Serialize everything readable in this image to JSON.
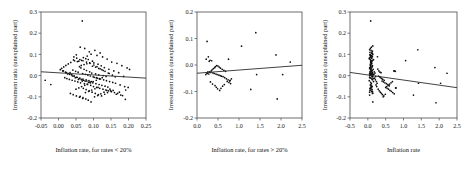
{
  "figure": {
    "background": "#ffffff",
    "point_color": "#0d0d0d",
    "axis_color": "#4a4a4a",
    "line_color": "#2b2b2b"
  },
  "chart_data": [
    {
      "type": "scatter",
      "title": "",
      "xlabel": "Inflation rate, for rates < 20%",
      "ylabel": "Investment ratio (unexplained part)",
      "xlim": [
        -0.05,
        0.25
      ],
      "ylim": [
        -0.2,
        0.3
      ],
      "xticks": [
        "-0.05",
        "0.00",
        "0.05",
        "0.10",
        "0.15",
        "0.20",
        "0.25"
      ],
      "xtick_values": [
        -0.05,
        0.0,
        0.05,
        0.1,
        0.15,
        0.2,
        0.25
      ],
      "yticks": [
        "0.3",
        "0.2",
        "0.1",
        "0.0",
        "-0.1",
        "-0.2"
      ],
      "ytick_values": [
        0.3,
        0.2,
        0.1,
        0.0,
        -0.1,
        -0.2
      ],
      "grid": false,
      "legend": "none",
      "trend_line": {
        "x0": -0.05,
        "y0": 0.018,
        "x1": 0.25,
        "y1": -0.012
      },
      "x": [
        0.068,
        0.062,
        0.075,
        0.088,
        0.051,
        0.104,
        0.119,
        0.082,
        0.071,
        0.093,
        0.043,
        0.058,
        0.11,
        0.126,
        0.139,
        0.152,
        0.167,
        0.181,
        0.196,
        0.203,
        0.035,
        0.028,
        0.021,
        0.015,
        0.009,
        0.046,
        0.054,
        0.066,
        0.078,
        0.085,
        0.097,
        0.101,
        0.113,
        0.122,
        0.131,
        0.144,
        0.158,
        0.172,
        0.186,
        0.191,
        0.06,
        0.064,
        0.073,
        0.08,
        0.089,
        0.095,
        0.106,
        0.115,
        0.128,
        0.136,
        0.041,
        0.049,
        0.056,
        0.069,
        0.077,
        0.084,
        0.091,
        0.099,
        0.108,
        0.117,
        0.033,
        0.026,
        0.038,
        0.044,
        0.052,
        0.061,
        0.07,
        0.079,
        0.087,
        0.094,
        0.102,
        0.111,
        0.12,
        0.129,
        0.137,
        0.146,
        0.155,
        0.163,
        0.176,
        0.189,
        0.065,
        0.072,
        0.081,
        0.09,
        0.098,
        0.107,
        0.116,
        0.124,
        0.133,
        0.141,
        0.018,
        0.024,
        0.031,
        0.039,
        0.047,
        0.055,
        0.063,
        0.074,
        0.083,
        0.092,
        0.1,
        0.109,
        0.118,
        0.127,
        0.135,
        0.143,
        0.151,
        0.16,
        0.169,
        0.178,
        0.012,
        0.02,
        0.029,
        0.037,
        0.045,
        0.053,
        0.059,
        0.067,
        0.076,
        0.086,
        -0.038,
        -0.022,
        0.005,
        0.014,
        0.023,
        0.032,
        0.04,
        0.048,
        0.057,
        0.068,
        0.071,
        0.079,
        0.088,
        0.096,
        0.105,
        0.114,
        0.123,
        0.132,
        0.14,
        0.149,
        0.062,
        0.07,
        0.078,
        0.085,
        0.093,
        0.103,
        0.112,
        0.121,
        0.13,
        0.138,
        0.05,
        0.058,
        0.066,
        0.075,
        0.082,
        0.091,
        0.099,
        0.108,
        0.117,
        0.125,
        0.034,
        0.042,
        0.051,
        0.06,
        0.069,
        0.077,
        0.086,
        0.095,
        0.104,
        0.113,
        0.147,
        0.156,
        0.165,
        0.174,
        0.183,
        0.192,
        0.199,
        0.145,
        0.154,
        0.162,
        0.065,
        0.073,
        0.081,
        0.089,
        0.097,
        0.106,
        0.115,
        0.124,
        0.133,
        0.142,
        0.044,
        0.052,
        0.061,
        0.07,
        0.08,
        0.09,
        0.101,
        0.11,
        0.119,
        0.128
      ],
      "y": [
        0.258,
        0.134,
        0.128,
        0.112,
        0.098,
        0.119,
        0.107,
        0.092,
        0.085,
        0.101,
        0.074,
        0.068,
        0.095,
        0.088,
        0.078,
        0.064,
        0.058,
        0.047,
        0.036,
        0.029,
        0.062,
        0.055,
        0.048,
        0.041,
        0.034,
        0.07,
        0.066,
        0.072,
        0.08,
        0.076,
        0.068,
        0.06,
        0.054,
        0.046,
        0.038,
        0.03,
        0.022,
        0.014,
        -0.004,
        -0.112,
        0.042,
        0.036,
        0.03,
        0.024,
        0.018,
        0.012,
        0.008,
        0.004,
        0.0,
        -0.004,
        0.026,
        0.02,
        0.016,
        0.01,
        0.006,
        0.002,
        -0.002,
        -0.006,
        -0.01,
        -0.014,
        0.014,
        0.008,
        0.004,
        -0.002,
        -0.008,
        -0.012,
        -0.016,
        -0.02,
        -0.024,
        -0.028,
        -0.008,
        -0.012,
        -0.016,
        -0.02,
        -0.024,
        -0.028,
        -0.032,
        -0.036,
        -0.044,
        -0.052,
        -0.018,
        -0.022,
        -0.026,
        -0.03,
        -0.034,
        -0.038,
        -0.042,
        -0.046,
        -0.05,
        -0.054,
        -0.01,
        -0.014,
        -0.018,
        -0.022,
        -0.026,
        -0.03,
        -0.034,
        -0.038,
        -0.042,
        -0.046,
        -0.052,
        -0.056,
        -0.06,
        -0.064,
        -0.068,
        -0.072,
        -0.076,
        -0.08,
        -0.084,
        -0.092,
        0.022,
        0.016,
        0.01,
        0.004,
        -0.002,
        -0.008,
        -0.014,
        -0.02,
        -0.026,
        -0.032,
        -0.022,
        -0.042,
        0.028,
        0.022,
        0.014,
        0.006,
        -0.002,
        -0.01,
        -0.018,
        -0.026,
        -0.06,
        -0.066,
        -0.072,
        -0.078,
        -0.084,
        -0.09,
        -0.096,
        -0.088,
        -0.08,
        -0.072,
        -0.098,
        -0.104,
        -0.11,
        -0.116,
        -0.124,
        -0.1,
        -0.094,
        -0.086,
        -0.078,
        -0.07,
        -0.064,
        -0.058,
        -0.052,
        -0.046,
        -0.04,
        -0.034,
        -0.028,
        -0.022,
        -0.016,
        -0.01,
        -0.084,
        -0.09,
        -0.096,
        -0.102,
        -0.108,
        -0.08,
        -0.074,
        -0.068,
        -0.062,
        -0.056,
        -0.064,
        -0.07,
        -0.088,
        -0.078,
        -0.094,
        -0.068,
        -0.056,
        0.01,
        0.002,
        -0.006,
        0.048,
        0.052,
        0.056,
        0.06,
        0.044,
        0.04,
        0.034,
        0.028,
        0.02,
        0.012,
        0.088,
        0.082,
        0.076,
        0.07,
        0.064,
        0.058,
        0.05,
        0.042,
        0.032,
        0.024
      ]
    },
    {
      "type": "scatter",
      "title": "",
      "xlabel": "Inflation rate, for rates > 20%",
      "ylabel": "Investment ratio (unexplained part)",
      "xlim": [
        0.0,
        2.5
      ],
      "ylim": [
        -0.2,
        0.2
      ],
      "xticks": [
        "0.0",
        "0.5",
        "1.0",
        "1.5",
        "2.0",
        "2.5"
      ],
      "xtick_values": [
        0.0,
        0.5,
        1.0,
        1.5,
        2.0,
        2.5
      ],
      "yticks": [
        "0.2",
        "0.1",
        "0.0",
        "-0.1",
        "-0.2"
      ],
      "ytick_values": [
        0.2,
        0.1,
        0.0,
        -0.1,
        -0.2
      ],
      "grid": false,
      "legend": "none",
      "trend_line": {
        "x0": 0.0,
        "y0": -0.031,
        "x1": 2.5,
        "y1": -0.001
      },
      "x": [
        0.24,
        0.27,
        0.22,
        0.31,
        0.35,
        0.29,
        0.26,
        0.33,
        0.38,
        0.41,
        0.45,
        0.48,
        0.52,
        0.55,
        0.58,
        0.62,
        0.66,
        0.7,
        0.74,
        0.78,
        0.23,
        0.25,
        0.28,
        0.3,
        0.34,
        0.36,
        0.39,
        0.42,
        0.44,
        0.47,
        0.5,
        0.53,
        0.56,
        0.6,
        0.64,
        0.68,
        0.72,
        0.76,
        0.8,
        0.82,
        0.21,
        0.32,
        0.37,
        0.43,
        0.46,
        0.49,
        0.54,
        0.57,
        0.61,
        0.65,
        1.06,
        1.28,
        1.4,
        1.42,
        1.88,
        1.91,
        2.04,
        2.22,
        0.75,
        0.79
      ],
      "y": [
        0.089,
        0.031,
        0.022,
        0.018,
        0.016,
        0.014,
        -0.026,
        -0.028,
        -0.03,
        -0.032,
        -0.034,
        -0.036,
        -0.038,
        -0.04,
        -0.042,
        -0.044,
        -0.048,
        -0.052,
        -0.056,
        -0.06,
        -0.03,
        -0.032,
        -0.034,
        -0.026,
        -0.022,
        -0.018,
        -0.014,
        -0.01,
        -0.006,
        -0.002,
        -0.004,
        -0.008,
        -0.012,
        -0.016,
        -0.02,
        -0.024,
        -0.062,
        -0.066,
        -0.07,
        -0.052,
        -0.036,
        -0.064,
        -0.072,
        -0.078,
        -0.084,
        -0.09,
        -0.096,
        -0.088,
        -0.08,
        -0.074,
        0.071,
        -0.092,
        0.122,
        -0.036,
        0.038,
        -0.128,
        -0.036,
        0.011,
        0.022,
        -0.058
      ]
    },
    {
      "type": "scatter",
      "title": "",
      "xlabel": "Inflation rate",
      "ylabel": "Investment ratio (unexplained part)",
      "xlim": [
        -0.5,
        2.5
      ],
      "ylim": [
        -0.2,
        0.3
      ],
      "xticks": [
        "-0.5",
        "0.0",
        "0.5",
        "1.0",
        "1.5",
        "2.0",
        "2.5"
      ],
      "xtick_values": [
        -0.5,
        0.0,
        0.5,
        1.0,
        1.5,
        2.0,
        2.5
      ],
      "yticks": [
        "0.3",
        "0.2",
        "0.1",
        "0.0",
        "-0.1",
        "-0.2"
      ],
      "ytick_values": [
        0.3,
        0.2,
        0.1,
        0.0,
        -0.1,
        -0.2
      ],
      "grid": false,
      "legend": "none",
      "trend_line": {
        "x0": -0.5,
        "y0": 0.015,
        "x1": 2.5,
        "y1": -0.057
      },
      "x": [
        0.08,
        0.1,
        0.07,
        0.12,
        0.06,
        0.09,
        0.11,
        0.13,
        0.05,
        0.14,
        0.08,
        0.1,
        0.07,
        0.12,
        0.06,
        0.09,
        0.11,
        0.13,
        0.05,
        0.15,
        0.08,
        0.1,
        0.07,
        0.12,
        0.06,
        0.09,
        0.11,
        0.14,
        0.04,
        0.16,
        0.08,
        0.1,
        0.07,
        0.12,
        0.06,
        0.09,
        0.11,
        0.13,
        0.05,
        0.15,
        0.08,
        0.1,
        0.07,
        0.12,
        0.06,
        0.09,
        0.11,
        0.13,
        0.05,
        0.14,
        0.08,
        0.1,
        0.07,
        0.12,
        0.06,
        0.09,
        0.11,
        0.13,
        0.05,
        0.15,
        0.08,
        0.1,
        0.07,
        0.12,
        0.06,
        0.09,
        0.11,
        0.13,
        0.04,
        0.16,
        0.08,
        0.1,
        0.07,
        0.12,
        0.06,
        0.09,
        0.11,
        0.13,
        0.05,
        0.14,
        0.18,
        0.2,
        0.17,
        0.22,
        0.19,
        0.21,
        0.24,
        0.26,
        0.23,
        0.25,
        0.28,
        0.31,
        0.34,
        0.37,
        0.4,
        0.44,
        0.48,
        0.52,
        0.56,
        0.6,
        0.3,
        0.33,
        0.36,
        0.39,
        0.42,
        0.46,
        0.5,
        0.54,
        0.58,
        0.62,
        0.66,
        0.7,
        0.74,
        0.78,
        0.29,
        0.32,
        0.35,
        0.38,
        0.41,
        0.45,
        0.49,
        0.53,
        0.57,
        0.61,
        0.65,
        0.69,
        0.73,
        0.77,
        0.27,
        0.43,
        1.06,
        1.28,
        1.4,
        1.42,
        1.88,
        1.91,
        2.04,
        2.22,
        0.75,
        0.79,
        0.09,
        0.11,
        0.08,
        0.1,
        0.07,
        0.12,
        0.06,
        0.13,
        0.05,
        0.14,
        0.09,
        0.11,
        0.08,
        0.1,
        0.07,
        0.12,
        0.06,
        0.13,
        0.05,
        0.14
      ],
      "y": [
        0.258,
        0.134,
        0.128,
        0.112,
        0.098,
        0.119,
        0.107,
        0.092,
        0.085,
        0.101,
        0.074,
        0.068,
        0.095,
        0.088,
        0.078,
        0.064,
        0.058,
        0.047,
        0.036,
        0.029,
        0.062,
        0.055,
        0.048,
        0.041,
        0.034,
        0.07,
        0.066,
        0.072,
        0.08,
        0.076,
        0.068,
        0.06,
        0.054,
        0.046,
        0.038,
        0.03,
        0.022,
        0.014,
        0.01,
        0.006,
        0.042,
        0.036,
        0.03,
        0.024,
        0.018,
        0.012,
        0.008,
        0.004,
        0.0,
        -0.004,
        0.026,
        0.02,
        0.016,
        0.01,
        0.006,
        0.002,
        -0.002,
        -0.006,
        -0.01,
        -0.014,
        0.014,
        0.008,
        0.004,
        -0.002,
        -0.008,
        -0.012,
        -0.016,
        -0.02,
        -0.024,
        -0.028,
        -0.032,
        -0.038,
        -0.044,
        -0.052,
        -0.06,
        -0.068,
        -0.076,
        -0.084,
        -0.092,
        -0.124,
        0.018,
        0.012,
        0.006,
        -0.004,
        -0.012,
        -0.02,
        -0.028,
        -0.036,
        -0.044,
        -0.052,
        0.031,
        0.022,
        0.016,
        0.014,
        -0.026,
        -0.03,
        -0.034,
        -0.038,
        -0.042,
        -0.048,
        -0.002,
        -0.006,
        -0.01,
        -0.014,
        -0.018,
        -0.022,
        -0.056,
        -0.06,
        -0.064,
        -0.07,
        -0.074,
        -0.08,
        -0.086,
        -0.058,
        -0.064,
        -0.072,
        -0.078,
        -0.084,
        -0.09,
        -0.096,
        -0.088,
        -0.052,
        -0.046,
        -0.04,
        -0.034,
        -0.028,
        0.022,
        0.02,
        0.089,
        -0.1,
        0.071,
        -0.092,
        0.122,
        -0.036,
        0.038,
        -0.128,
        -0.036,
        0.011,
        0.022,
        -0.058,
        -0.046,
        -0.05,
        -0.054,
        -0.058,
        -0.062,
        -0.066,
        -0.07,
        -0.074,
        -0.078,
        -0.082,
        0.086,
        0.082,
        0.09,
        0.094,
        0.1,
        0.104,
        0.11,
        0.116,
        0.122,
        0.14
      ]
    }
  ]
}
